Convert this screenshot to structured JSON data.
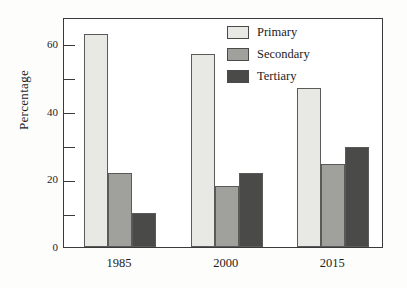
{
  "chart_data": {
    "type": "bar",
    "title": "",
    "xlabel": "",
    "ylabel": "Percentage",
    "categories": [
      "1985",
      "2000",
      "2015"
    ],
    "series": [
      {
        "name": "Primary",
        "values": [
          63,
          57,
          47
        ],
        "color": "#e8e8e4"
      },
      {
        "name": "Secondary",
        "values": [
          22,
          18,
          24.5
        ],
        "color": "#a0a09c"
      },
      {
        "name": "Tertiary",
        "values": [
          10,
          22,
          29.5
        ],
        "color": "#4a4a48"
      }
    ],
    "ylim": [
      0,
      68
    ],
    "ytick_major": [
      0,
      20,
      40,
      60
    ],
    "ytick_minor": [
      10,
      30,
      50
    ],
    "ytick_labels": [
      "0",
      "20",
      "40",
      "60"
    ],
    "grid": false,
    "legend_position": "top-right",
    "frame": true
  },
  "legend": {
    "items": [
      {
        "label": "Primary"
      },
      {
        "label": "Secondary"
      },
      {
        "label": "Tertiary"
      }
    ]
  },
  "axis": {
    "y_title": "Percentage"
  },
  "scan": {
    "edge_text": ""
  }
}
